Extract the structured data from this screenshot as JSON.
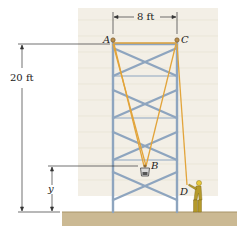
{
  "figure": {
    "labels": {
      "A": "A",
      "B": "B",
      "C": "C",
      "D": "D",
      "y": "y"
    },
    "dimensions": {
      "width_label": "8 ft",
      "height_label": "20 ft"
    },
    "colors": {
      "wall": "#f1ede4",
      "brick_line": "#e3ddd0",
      "scaffold": "#8fa6c0",
      "rope": "#e2a43a",
      "ground": "#c9b790",
      "ground_edge": "#a89468",
      "worker": "#b59a2a",
      "dim_line": "#333333"
    }
  }
}
